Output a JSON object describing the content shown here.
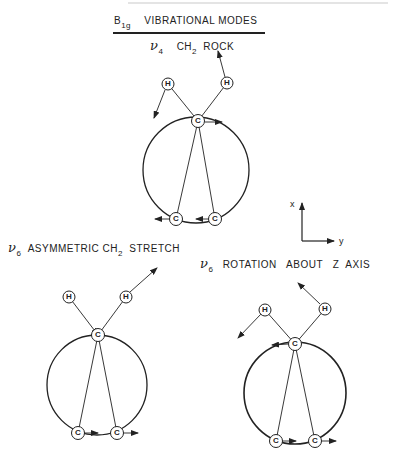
{
  "title": {
    "symbol": "B",
    "symbol_sub": "1g",
    "text": "VIBRATIONAL  MODES"
  },
  "modes": [
    {
      "nu": "ν",
      "nu_sub": "4",
      "label_a": "CH",
      "label_a_sub": "2",
      "label_b": "ROCK"
    },
    {
      "nu": "ν",
      "nu_sub": "6",
      "label_a": "ASYMMETRIC  CH",
      "label_a_sub": "2",
      "label_b": "STRETCH"
    },
    {
      "nu": "ν",
      "nu_sub": "6",
      "label_a": "ROTATION   ABOUT   Z  AXIS",
      "label_a_sub": "",
      "label_b": ""
    }
  ],
  "axes": {
    "x_label": "x",
    "y_label": "y"
  },
  "atoms": {
    "hydrogen": "H",
    "carbon": "C"
  },
  "colors": {
    "ink": "#222222",
    "background": "#ffffff"
  }
}
